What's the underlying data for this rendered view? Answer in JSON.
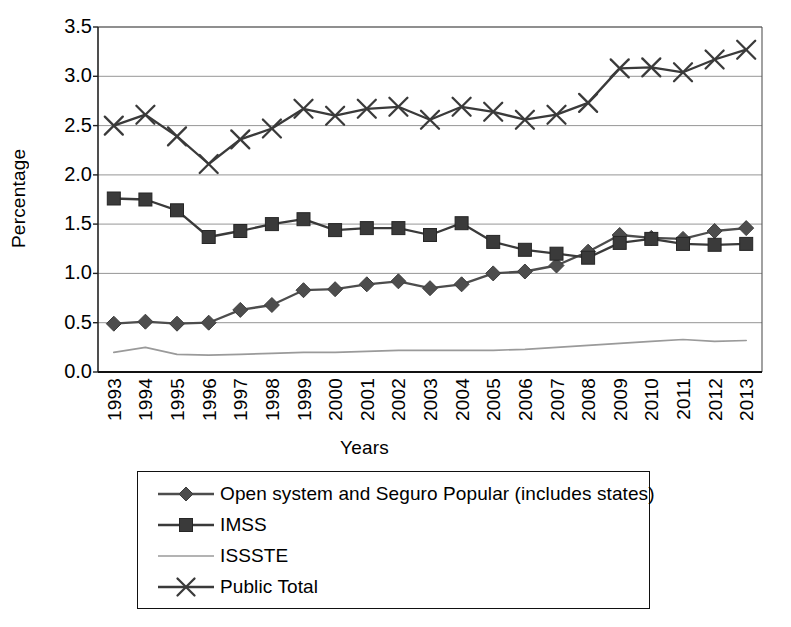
{
  "chart_data": {
    "type": "line",
    "title": "",
    "xlabel": "Years",
    "ylabel": "Percentage",
    "ylim": [
      0.0,
      3.5
    ],
    "ytick_labels": [
      "0.0",
      "0.5",
      "1.0",
      "1.5",
      "2.0",
      "2.5",
      "3.0",
      "3.5"
    ],
    "ytick_values": [
      0.0,
      0.5,
      1.0,
      1.5,
      2.0,
      2.5,
      3.0,
      3.5
    ],
    "grid": "horizontal",
    "legend_position": "below-plot",
    "categories": [
      "1993",
      "1994",
      "1995",
      "1996",
      "1997",
      "1998",
      "1999",
      "2000",
      "2001",
      "2002",
      "2003",
      "2004",
      "2005",
      "2006",
      "2007",
      "2008",
      "2009",
      "2010",
      "2011",
      "2012",
      "2013"
    ],
    "series": [
      {
        "name": "Open system and Seguro Popular (includes states)",
        "marker": "diamond",
        "color": "#4d4d4d",
        "values": [
          0.49,
          0.51,
          0.49,
          0.5,
          0.63,
          0.68,
          0.83,
          0.84,
          0.89,
          0.92,
          0.85,
          0.89,
          1.0,
          1.02,
          1.08,
          1.22,
          1.39,
          1.36,
          1.35,
          1.43,
          1.46
        ]
      },
      {
        "name": "IMSS",
        "marker": "square",
        "color": "#3a3a3a",
        "values": [
          1.76,
          1.75,
          1.64,
          1.37,
          1.43,
          1.5,
          1.55,
          1.44,
          1.46,
          1.46,
          1.39,
          1.51,
          1.32,
          1.24,
          1.2,
          1.16,
          1.31,
          1.35,
          1.3,
          1.29,
          1.3
        ]
      },
      {
        "name": "ISSSTE",
        "marker": "none",
        "color": "#9a9a9a",
        "values": [
          0.2,
          0.25,
          0.18,
          0.17,
          0.18,
          0.19,
          0.2,
          0.2,
          0.21,
          0.22,
          0.22,
          0.22,
          0.22,
          0.23,
          0.25,
          0.27,
          0.29,
          0.31,
          0.33,
          0.31,
          0.32
        ]
      },
      {
        "name": "Public Total",
        "marker": "x",
        "color": "#3a3a3a",
        "values": [
          2.5,
          2.61,
          2.39,
          2.11,
          2.36,
          2.47,
          2.67,
          2.6,
          2.67,
          2.69,
          2.56,
          2.69,
          2.64,
          2.56,
          2.61,
          2.73,
          3.08,
          3.09,
          3.04,
          3.17,
          3.27
        ]
      }
    ]
  },
  "legend": {
    "items": [
      {
        "label": "Open system and Seguro Popular (includes states)",
        "marker": "diamond",
        "color": "#4d4d4d"
      },
      {
        "label": "IMSS",
        "marker": "square",
        "color": "#3a3a3a"
      },
      {
        "label": "ISSSTE",
        "marker": "none",
        "color": "#9a9a9a"
      },
      {
        "label": "Public Total",
        "marker": "x",
        "color": "#3a3a3a"
      }
    ]
  },
  "colors": {
    "axis": "#1a1a1a",
    "grid": "#8a8a8a",
    "background": "#ffffff"
  }
}
